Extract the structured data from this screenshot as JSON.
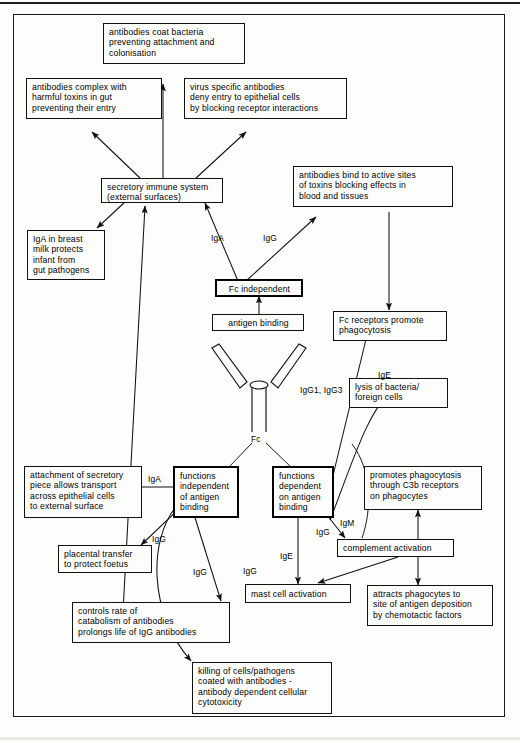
{
  "diagram": {
    "frame_color": "#1a1a1a",
    "nodes": {
      "coat_bacteria": "antibodies coat bacteria\npreventing attachment and\ncolonisation",
      "complex_toxins": "antibodies complex with\nharmful toxins in gut\npreventing their entry",
      "virus_specific": "virus specific antibodies\ndeny entry to epithelial cells\nby blocking receptor interactions",
      "secretory_immune": "secretory immune system\n(external surfaces)",
      "bind_active_sites": "antibodies bind to active sites\nof toxins blocking effects in\nblood and tissues",
      "iga_breast_milk": "IgA in breast\nmilk protects\ninfant from\ngut pathogens",
      "fc_independent": "Fc independent",
      "antigen_binding": "antigen binding",
      "fc_receptors": "Fc receptors promote\nphagocytosis",
      "lysis_bacteria": "lysis of bacteria/\nforeign cells",
      "attachment_secretory": "attachment of secretory\npiece allows transport\nacross epithelial cells\nto external surface",
      "functions_independent": "functions\nindependent\nof antigen\nbinding",
      "functions_dependent": "functions\ndependent\non antigen\nbinding",
      "promotes_phagocytosis": "promotes phagocytosis\nthrough C3b receptors\non phagocytes",
      "placental_transfer": "placental transfer\nto protect foetus",
      "complement_activation": "complement activation",
      "mast_cell": "mast cell activation",
      "attracts_phagocytes": "attracts phagocytes to\nsite of antigen deposition\nby chemotactic factors",
      "controls_catabolism": "controls rate of\ncatabolism of antibodies\nprolongs life of IgG antibodies",
      "killing_cells": "killing of cells/pathogens\ncoated with antibodies -\nantibody dependent cellular\ncytotoxicity"
    },
    "antibody_label": "Fc",
    "edge_labels": {
      "iga_to_secretory": "IgA",
      "igg_to_toxin_sites": "IgG",
      "igg1_igg3": "IgG1, IgG3",
      "ige_to_fc_receptors": "IgE",
      "iga_to_attachment": "IgA",
      "igg_to_placental": "IgG",
      "igg_to_catabolism": "IgG",
      "igg_curve_killing": "IgG",
      "ige_to_mast": "IgE",
      "igg_to_complement": "IgG",
      "igm_to_complement": "IgM"
    }
  }
}
